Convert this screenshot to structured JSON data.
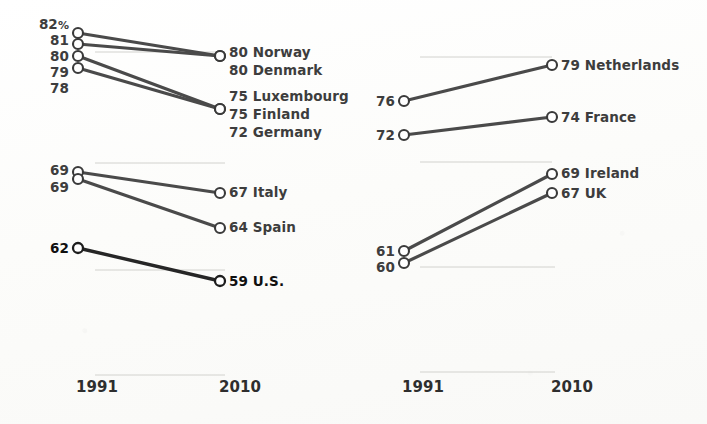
{
  "figure": {
    "title": "",
    "value_suffix": "%",
    "axis_years": [
      "1991",
      "2010"
    ]
  },
  "chart_data": {
    "type": "line",
    "chart_style": "slope-chart",
    "title": "",
    "subtitle": "",
    "xlabel": "",
    "ylabel": "",
    "x": [
      "1991",
      "2010"
    ],
    "unit": "%",
    "grid": "faint-horizontal",
    "legend": "none",
    "panels": [
      {
        "panel_name": "top-left",
        "left_tick_labels": [
          "82%",
          "81",
          "80",
          "79",
          "78"
        ],
        "left_tick_values": [
          82,
          81,
          80,
          79,
          78
        ],
        "right_tick_labels": [
          "80 Norway",
          "80 Denmark",
          "75 Luxembourg",
          "75 Finland",
          "72 Germany"
        ],
        "series": [
          {
            "name": "Norway",
            "values": [
              82,
              80
            ],
            "start_label": "82%",
            "end_label": "80 Norway",
            "emphasis": false
          },
          {
            "name": "Denmark",
            "values": [
              81,
              80
            ],
            "start_label": "81",
            "end_label": "80 Denmark",
            "emphasis": false
          },
          {
            "name": "Luxembourg",
            "values": [
              80,
              75
            ],
            "start_label": "80",
            "end_label": "75 Luxembourg",
            "emphasis": false
          },
          {
            "name": "Finland",
            "values": [
              79,
              75
            ],
            "start_label": "79",
            "end_label": "75 Finland",
            "emphasis": false
          },
          {
            "name": "Germany",
            "values": [
              78,
              72
            ],
            "start_label": "78",
            "end_label": "72 Germany",
            "emphasis": false
          }
        ]
      },
      {
        "panel_name": "bottom-left",
        "left_tick_labels": [
          "69",
          "69",
          "62"
        ],
        "left_tick_values": [
          69,
          69,
          62
        ],
        "right_tick_labels": [
          "67 Italy",
          "64 Spain",
          "59 U.S."
        ],
        "series": [
          {
            "name": "Italy",
            "values": [
              69,
              67
            ],
            "start_label": "69",
            "end_label": "67 Italy",
            "emphasis": false
          },
          {
            "name": "Spain",
            "values": [
              69,
              64
            ],
            "start_label": "69",
            "end_label": "64 Spain",
            "emphasis": false
          },
          {
            "name": "U.S.",
            "values": [
              62,
              59
            ],
            "start_label": "62",
            "end_label": "59 U.S.",
            "emphasis": true
          }
        ]
      },
      {
        "panel_name": "top-right",
        "left_tick_labels": [
          "76",
          "72"
        ],
        "left_tick_values": [
          76,
          72
        ],
        "right_tick_labels": [
          "79 Netherlands",
          "74 France"
        ],
        "series": [
          {
            "name": "Netherlands",
            "values": [
              76,
              79
            ],
            "start_label": "76",
            "end_label": "79 Netherlands",
            "emphasis": false
          },
          {
            "name": "France",
            "values": [
              72,
              74
            ],
            "start_label": "72",
            "end_label": "74 France",
            "emphasis": false
          }
        ]
      },
      {
        "panel_name": "bottom-right",
        "left_tick_labels": [
          "61",
          "60"
        ],
        "left_tick_values": [
          61,
          60
        ],
        "right_tick_labels": [
          "69 Ireland",
          "67 UK"
        ],
        "series": [
          {
            "name": "Ireland",
            "values": [
              61,
              69
            ],
            "start_label": "61",
            "end_label": "69 Ireland",
            "emphasis": false
          },
          {
            "name": "UK",
            "values": [
              60,
              67
            ],
            "start_label": "60",
            "end_label": "67 UK",
            "emphasis": false
          }
        ]
      }
    ],
    "axis_tick_labels": {
      "left_chart": [
        "1991",
        "2010"
      ],
      "right_chart": [
        "1991",
        "2010"
      ]
    }
  },
  "geometry": {
    "left_panel_x": {
      "start": 78,
      "end": 220
    },
    "right_panel_x": {
      "start": 404,
      "end": 552
    },
    "axis_label_y": 392,
    "left_axis_label_x": {
      "start": 97,
      "end": 240
    },
    "right_axis_label_x": {
      "start": 423,
      "end": 572
    },
    "points": {
      "top-left": {
        "left": [
          {
            "v": 82,
            "y": 33
          },
          {
            "v": 81,
            "y": 44
          },
          {
            "v": 80,
            "y": 56
          },
          {
            "v": 79,
            "y": 68
          }
        ],
        "right": [
          {
            "v": 80,
            "y": 56
          },
          {
            "v": 75,
            "y": 109
          },
          {
            "v": 72,
            "y": 131
          }
        ]
      },
      "bottom-left": {
        "left": [
          {
            "v": 69,
            "y": 172
          },
          {
            "v": 69,
            "y": 179
          },
          {
            "v": 62,
            "y": 248
          }
        ],
        "right": [
          {
            "v": 67,
            "y": 193
          },
          {
            "v": 64,
            "y": 228
          },
          {
            "v": 59,
            "y": 281
          }
        ]
      },
      "top-right": {
        "left": [
          {
            "v": 76,
            "y": 101
          },
          {
            "v": 72,
            "y": 135
          }
        ],
        "right": [
          {
            "v": 79,
            "y": 65
          },
          {
            "v": 74,
            "y": 117
          }
        ]
      },
      "bottom-right": {
        "left": [
          {
            "v": 61,
            "y": 251
          },
          {
            "v": 60,
            "y": 263
          }
        ],
        "right": [
          {
            "v": 69,
            "y": 174
          },
          {
            "v": 67,
            "y": 193
          }
        ]
      }
    },
    "gridlines": [
      {
        "x1": 95,
        "x2": 225,
        "y": 52
      },
      {
        "x1": 95,
        "x2": 225,
        "y": 163
      },
      {
        "x1": 95,
        "x2": 225,
        "y": 270
      },
      {
        "x1": 95,
        "x2": 225,
        "y": 375
      },
      {
        "x1": 420,
        "x2": 552,
        "y": 57
      },
      {
        "x1": 420,
        "x2": 552,
        "y": 162
      },
      {
        "x1": 420,
        "x2": 555,
        "y": 267
      },
      {
        "x1": 420,
        "x2": 555,
        "y": 372
      }
    ]
  },
  "ticks": {
    "top-left": [
      {
        "label": "82%",
        "y": 29,
        "bold": false
      },
      {
        "label": "81",
        "y": 45,
        "bold": false
      },
      {
        "label": "80",
        "y": 61,
        "bold": false
      },
      {
        "label": "79",
        "y": 77,
        "bold": false
      },
      {
        "label": "78",
        "y": 93,
        "bold": false
      }
    ],
    "bottom-left": [
      {
        "label": "69",
        "y": 175,
        "bold": false
      },
      {
        "label": "69",
        "y": 192,
        "bold": false
      },
      {
        "label": "62",
        "y": 253,
        "bold": true
      }
    ],
    "top-right": [
      {
        "label": "76",
        "y": 106,
        "bold": false
      },
      {
        "label": "72",
        "y": 140,
        "bold": false
      }
    ],
    "bottom-right": [
      {
        "label": "61",
        "y": 256,
        "bold": false
      },
      {
        "label": "60",
        "y": 272,
        "bold": false
      }
    ]
  },
  "end_labels": {
    "top-left": [
      {
        "label": "80 Norway",
        "y": 57,
        "bold": false
      },
      {
        "label": "80 Denmark",
        "y": 75,
        "bold": false
      },
      {
        "label": "75 Luxembourg",
        "y": 101,
        "bold": false
      },
      {
        "label": "75 Finland",
        "y": 119,
        "bold": false
      },
      {
        "label": "72 Germany",
        "y": 137,
        "bold": false
      }
    ],
    "bottom-left": [
      {
        "label": "67 Italy",
        "y": 197,
        "bold": false
      },
      {
        "label": "64 Spain",
        "y": 232,
        "bold": false
      },
      {
        "label": "59 U.S.",
        "y": 286,
        "bold": true
      }
    ],
    "top-right": [
      {
        "label": "79 Netherlands",
        "y": 70,
        "bold": false
      },
      {
        "label": "74 France",
        "y": 122,
        "bold": false
      }
    ],
    "bottom-right": [
      {
        "label": "69 Ireland",
        "y": 178,
        "bold": false
      },
      {
        "label": "67 UK",
        "y": 198,
        "bold": false
      }
    ]
  },
  "axis": {
    "left": [
      {
        "label": "1991",
        "x": 97,
        "y": 392
      },
      {
        "label": "2010",
        "x": 240,
        "y": 392
      }
    ],
    "right": [
      {
        "label": "1991",
        "x": 423,
        "y": 392
      },
      {
        "label": "2010",
        "x": 572,
        "y": 392
      }
    ]
  }
}
